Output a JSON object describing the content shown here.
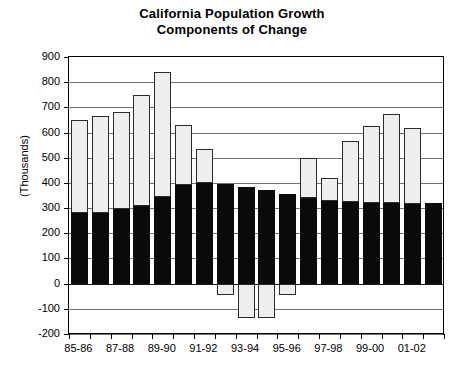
{
  "chart_data": {
    "type": "bar",
    "title": "California Population Growth Components of Change",
    "title_line1": "California Population Growth",
    "title_line2": "Components of Change",
    "xlabel": "",
    "ylabel": "(Thousands)",
    "ylim": [
      -200,
      900
    ],
    "ytick_values": [
      900,
      800,
      700,
      600,
      500,
      400,
      300,
      200,
      100,
      0,
      -100,
      -200
    ],
    "ytick_labels": [
      "900",
      "800",
      "700",
      "600",
      "500",
      "400",
      "300",
      "200",
      "100",
      "0",
      "-100",
      "-200"
    ],
    "grid": true,
    "legend": "none",
    "stacked": true,
    "categories": [
      "85-86",
      "86-87",
      "87-88",
      "88-89",
      "89-90",
      "90-91",
      "91-92",
      "92-93",
      "93-94",
      "94-95",
      "95-96",
      "96-97",
      "97-98",
      "98-99",
      "99-00",
      "00-01",
      "01-02",
      "02-03"
    ],
    "xtick_labels_shown": [
      "85-86",
      "87-88",
      "89-90",
      "91-92",
      "93-94",
      "95-96",
      "97-98",
      "99-00",
      "01-02"
    ],
    "series": [
      {
        "name": "Natural Increase",
        "color": "#0a0a0a",
        "values": [
          280,
          280,
          295,
          310,
          345,
          390,
          400,
          395,
          385,
          370,
          355,
          340,
          330,
          325,
          320,
          320,
          318,
          320
        ]
      },
      {
        "name": "Net Migration",
        "color": "#eeeeee",
        "values": [
          370,
          385,
          385,
          440,
          495,
          240,
          135,
          -45,
          -135,
          -135,
          -45,
          160,
          90,
          240,
          305,
          355,
          300,
          0
        ]
      }
    ],
    "totals": [
      650,
      665,
      680,
      750,
      840,
      630,
      535,
      350,
      250,
      235,
      310,
      500,
      420,
      565,
      625,
      675,
      618,
      320
    ]
  }
}
